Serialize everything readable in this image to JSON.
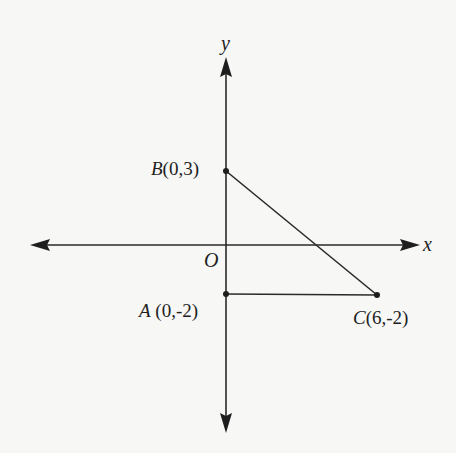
{
  "diagram": {
    "type": "coordinate-plane",
    "axes": {
      "x_label": "x",
      "y_label": "y",
      "origin_label": "O"
    },
    "points": [
      {
        "name": "B",
        "coords": "(0,3)",
        "x": 0,
        "y": 3
      },
      {
        "name": "A",
        "coords": "(0,-2)",
        "x": 0,
        "y": -2
      },
      {
        "name": "C",
        "coords": "(6,-2)",
        "x": 6,
        "y": -2
      }
    ],
    "segments": [
      {
        "from": "B",
        "to": "C"
      },
      {
        "from": "A",
        "to": "C"
      }
    ],
    "colors": {
      "stroke": "#2a2a2a",
      "background": "#f7f7f5"
    }
  }
}
